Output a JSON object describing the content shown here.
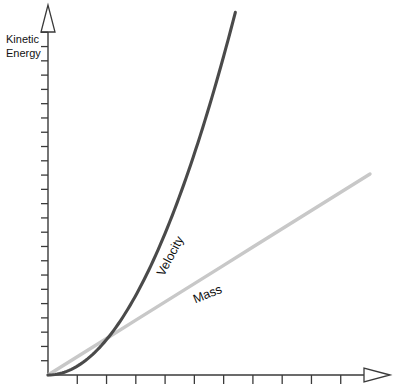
{
  "chart_data": {
    "type": "line",
    "title": "",
    "subtitle": "",
    "xlabel": "",
    "ylabel": "Kinetic Energy",
    "ylabel_line1": "Kinetic",
    "ylabel_line2": "Energy",
    "xlim": [
      0,
      11
    ],
    "ylim": [
      0,
      25
    ],
    "grid": false,
    "legend_position": "inline-labels",
    "axis_color": "#3a3a3a",
    "background": "#ffffff",
    "x_ticks": [
      1,
      2,
      3,
      4,
      5,
      6,
      7,
      8,
      9,
      10
    ],
    "x_tick_labels": [
      "",
      "",
      "",
      "",
      "",
      "",
      "",
      "",
      "",
      ""
    ],
    "y_ticks": [
      1,
      2,
      3,
      4,
      5,
      6,
      7,
      8,
      9,
      10,
      11,
      12,
      13,
      14,
      15,
      16,
      17,
      18,
      19,
      20,
      21,
      22,
      23,
      24
    ],
    "y_tick_labels": [
      "",
      "",
      "",
      "",
      "",
      "",
      "",
      "",
      "",
      "",
      "",
      "",
      "",
      "",
      "",
      "",
      "",
      "",
      "",
      "",
      "",
      "",
      "",
      ""
    ],
    "annotations": [
      {
        "text": "Velocity",
        "x": 4.3,
        "y": 8.2,
        "rotation": -62,
        "color": "#111111"
      },
      {
        "text": "Mass",
        "x": 5.5,
        "y": 5.4,
        "rotation": -22,
        "color": "#111111"
      }
    ],
    "series": [
      {
        "name": "Velocity",
        "label": "Velocity",
        "type": "quadratic",
        "color": "#4a4a4a",
        "width": 3.1,
        "note": "Kinetic energy grows as the square of velocity",
        "x": [
          0,
          0.5,
          1,
          1.5,
          2,
          2.5,
          3,
          3.5,
          4,
          4.5,
          5,
          5.5,
          6,
          6.4
        ],
        "values": [
          0,
          0.06,
          0.25,
          0.56,
          1.0,
          1.56,
          2.25,
          3.06,
          4.0,
          5.06,
          6.25,
          7.56,
          9.0,
          10.24
        ],
        "scaled_note": "plotted y = 0.62 * x^2 in data units"
      },
      {
        "name": "Mass",
        "label": "Mass",
        "type": "linear",
        "color": "#c8c8c8",
        "width": 3.4,
        "note": "Kinetic energy grows linearly with mass",
        "x": [
          0,
          1,
          2,
          3,
          4,
          5,
          6,
          7,
          8,
          9,
          10,
          11
        ],
        "values": [
          0,
          1.28,
          2.56,
          3.84,
          5.12,
          6.4,
          7.68,
          8.96,
          10.24,
          11.52,
          12.8,
          14.08
        ],
        "scaled_note": "plotted y = 1.28 * x in data units"
      }
    ],
    "crossing_point": {
      "x": 2.07,
      "y": 2.65,
      "note": "curves intersect where 0.62x^2 = 1.28x"
    }
  },
  "axes": {
    "y_arrow": "open-triangle-up",
    "x_arrow": "open-triangle-right"
  }
}
